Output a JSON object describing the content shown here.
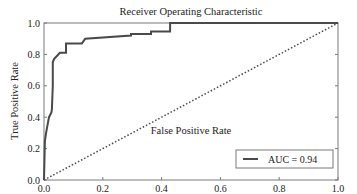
{
  "chart_data": {
    "type": "line",
    "title": "Receiver Operating Characteristic",
    "xlabel": "False Positive Rate",
    "ylabel": "True Positive Rate",
    "xlim": [
      0.0,
      1.0
    ],
    "ylim": [
      0.0,
      1.0
    ],
    "xticks": [
      "0.0",
      "0.2",
      "0.4",
      "0.6",
      "0.8",
      "1.0"
    ],
    "yticks": [
      "0.0",
      "0.2",
      "0.4",
      "0.6",
      "0.8",
      "1.0"
    ],
    "grid": false,
    "legend_position": "lower right",
    "series": [
      {
        "name": "AUC = 0.94",
        "style": "solid",
        "color": "#4a4a4a",
        "x": [
          0.0,
          0.003,
          0.007,
          0.012,
          0.017,
          0.025,
          0.027,
          0.03,
          0.03,
          0.034,
          0.044,
          0.054,
          0.075,
          0.075,
          0.129,
          0.14,
          0.296,
          0.296,
          0.364,
          0.364,
          0.429,
          0.429,
          1.0
        ],
        "y": [
          0.0,
          0.25,
          0.3,
          0.35,
          0.4,
          0.43,
          0.45,
          0.6,
          0.75,
          0.77,
          0.79,
          0.81,
          0.81,
          0.87,
          0.87,
          0.9,
          0.92,
          0.93,
          0.93,
          0.945,
          0.945,
          1.0,
          1.0
        ]
      },
      {
        "name": "chance",
        "style": "dotted",
        "color": "#4a4a4a",
        "x": [
          0.0,
          1.0
        ],
        "y": [
          0.0,
          1.0
        ]
      }
    ],
    "annotations": []
  },
  "legend": {
    "entries": [
      {
        "label": "AUC = 0.94"
      }
    ]
  }
}
